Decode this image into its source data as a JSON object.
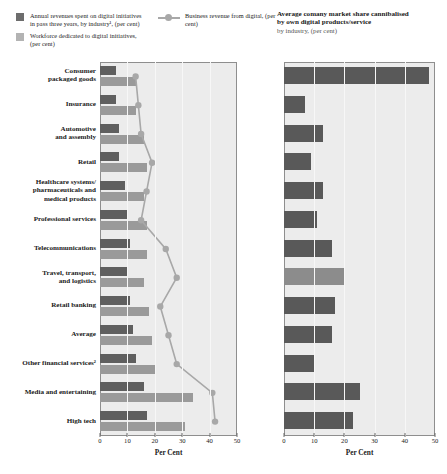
{
  "legend": {
    "series": [
      {
        "key": "annual_revenues",
        "swatch": "dark",
        "label": "Annual revenues spent on digital initiatives in pass three years, by industry¹, (per cent)"
      },
      {
        "key": "workforce",
        "swatch": "light",
        "label": "Workforce dedicated to digital initiatives, (per cent)"
      },
      {
        "key": "business_revenue",
        "swatch": "line",
        "label": "Business revenue from digital, (per cent)"
      }
    ]
  },
  "right_panel": {
    "title_line1": "Average comany market share cannibalised",
    "title_line2": "by own digital products/service",
    "subtitle": "by industry, (per cent)"
  },
  "colors": {
    "dark_bar": "#5f5f5f",
    "light_bar": "#9a9a9a",
    "line": "#a8a8a8",
    "plot_bg": "#ececec",
    "frame": "#8e8e8e"
  },
  "chart_data": [
    {
      "id": "left",
      "type": "bar",
      "orientation": "horizontal",
      "title": "",
      "xlabel": "Per Cent",
      "ylabel": "",
      "xlim": [
        0,
        50
      ],
      "xticks": [
        0,
        10,
        20,
        30,
        40,
        50
      ],
      "grid": true,
      "legend_position": "top-left",
      "categories": [
        "Consumer packaged goods",
        "Insurance",
        "Automotive and assembly",
        "Retail",
        "Healthcare systems/ pharmaceuticals and medical products",
        "Professional services",
        "Telecommunications",
        "Travel, transport, and logistics",
        "Retail banking",
        "Average",
        "Other financial services²",
        "Media and entertaining",
        "High tech"
      ],
      "series": [
        {
          "name": "Annual revenues spent on digital initiatives in pass three years, by industry¹, (per cent)",
          "values": [
            6,
            6,
            7,
            7,
            9,
            10,
            11,
            10,
            11,
            12,
            13,
            16,
            17
          ]
        },
        {
          "name": "Workforce dedicated to digital initiatives, (per cent)",
          "values": [
            13,
            13,
            16,
            17,
            16,
            17,
            17,
            16,
            18,
            19,
            20,
            34,
            31
          ]
        },
        {
          "name": "Business revenue from digital, (per cent)",
          "values": [
            13,
            14,
            15,
            19,
            17,
            15,
            24,
            28,
            22,
            25,
            28,
            41,
            42
          ]
        }
      ]
    },
    {
      "id": "right",
      "type": "bar",
      "orientation": "horizontal",
      "title": "Average comany market share cannibalised by own digital products/service",
      "subtitle": "by industry, (per cent)",
      "xlabel": "Per Cent",
      "ylabel": "",
      "xlim": [
        0,
        50
      ],
      "xticks": [
        0,
        10,
        20,
        30,
        40,
        50
      ],
      "grid": true,
      "categories": [
        "Consumer packaged goods",
        "Insurance",
        "Automotive and assembly",
        "Retail",
        "Healthcare systems/ pharmaceuticals and medical products",
        "Professional services",
        "Telecommunications",
        "Travel, transport, and logistics",
        "Retail banking",
        "Average",
        "Other financial services²",
        "Media and entertaining",
        "High tech"
      ],
      "values": [
        48,
        7,
        13,
        9,
        13,
        11,
        16,
        20,
        17,
        16,
        10,
        25,
        23
      ],
      "highlight_index": 7
    }
  ],
  "categories_display": [
    [
      "Consumer",
      "packaged goods"
    ],
    [
      "Insurance"
    ],
    [
      "Automotive",
      "and assembly"
    ],
    [
      "Retail"
    ],
    [
      "Healthcare systems/",
      "pharmaceuticals and",
      "medical products"
    ],
    [
      "Professional services"
    ],
    [
      "Telecommunications"
    ],
    [
      "Travel, transport,",
      "and logistics"
    ],
    [
      "Retail banking"
    ],
    [
      "Average"
    ],
    [
      "Other financial services²"
    ],
    [
      "Media and entertaining"
    ],
    [
      "High tech"
    ]
  ],
  "axis": {
    "xlabel": "Per Cent",
    "ticks": [
      "0",
      "10",
      "20",
      "30",
      "40",
      "50"
    ]
  }
}
